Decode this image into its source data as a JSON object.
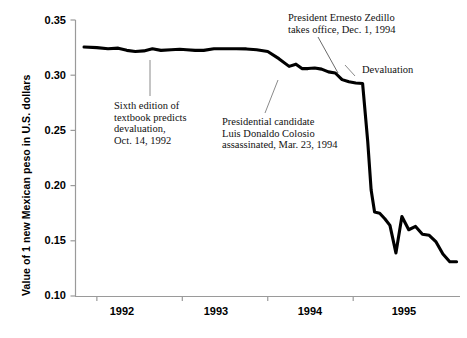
{
  "chart_data": {
    "type": "line",
    "title": "",
    "xlabel": "",
    "ylabel": "Value of 1 new Mexican peso in U.S. dollars",
    "ylim": [
      0.1,
      0.35
    ],
    "xlim": [
      1991.5,
      1996.0
    ],
    "yticks": [
      "0.35",
      "0.30",
      "0.25",
      "0.20",
      "0.15",
      "0.10"
    ],
    "ytick_values": [
      0.35,
      0.3,
      0.25,
      0.2,
      0.15,
      0.1
    ],
    "xticks": [
      "1992",
      "1993",
      "1994",
      "1995"
    ],
    "xtick_values": [
      1992,
      1993,
      1994,
      1995
    ],
    "grid": false,
    "legend": null,
    "series": [
      {
        "name": "Mexican peso value in U.S. dollars",
        "color": "#000000",
        "x": [
          1991.6,
          1991.75,
          1991.88,
          1992.0,
          1992.1,
          1992.2,
          1992.3,
          1992.4,
          1992.5,
          1992.62,
          1992.72,
          1992.8,
          1992.9,
          1993.0,
          1993.12,
          1993.25,
          1993.38,
          1993.5,
          1993.62,
          1993.75,
          1993.88,
          1994.0,
          1994.08,
          1994.15,
          1994.22,
          1994.3,
          1994.38,
          1994.46,
          1994.54,
          1994.62,
          1994.7,
          1994.78,
          1994.86,
          1994.92,
          1994.96,
          1995.0,
          1995.06,
          1995.12,
          1995.18,
          1995.25,
          1995.32,
          1995.4,
          1995.48,
          1995.56,
          1995.64,
          1995.72,
          1995.8,
          1995.88,
          1995.96
        ],
        "y": [
          0.3255,
          0.325,
          0.324,
          0.3245,
          0.3225,
          0.3215,
          0.322,
          0.324,
          0.3225,
          0.323,
          0.3235,
          0.323,
          0.3225,
          0.3225,
          0.324,
          0.324,
          0.324,
          0.3238,
          0.323,
          0.3215,
          0.315,
          0.308,
          0.31,
          0.306,
          0.306,
          0.3065,
          0.3055,
          0.303,
          0.302,
          0.296,
          0.294,
          0.293,
          0.2925,
          0.24,
          0.196,
          0.176,
          0.175,
          0.17,
          0.164,
          0.139,
          0.172,
          0.16,
          0.163,
          0.156,
          0.155,
          0.149,
          0.138,
          0.131,
          0.131
        ]
      }
    ],
    "annotations": [
      {
        "id": "textbook",
        "lines": [
          "Sixth edition of",
          "textbook predicts",
          "devaluation,",
          "Oct. 14, 1992"
        ],
        "text": "Sixth edition of textbook predicts devaluation, Oct. 14, 1992",
        "date": "Oct. 14, 1992"
      },
      {
        "id": "colosio",
        "lines": [
          "Presidential candidate",
          "Luis Donaldo Colosio",
          "assassinated, Mar. 23, 1994"
        ],
        "text": "Presidential candidate Luis Donaldo Colosio assassinated, Mar. 23, 1994",
        "date": "Mar. 23, 1994"
      },
      {
        "id": "zedillo",
        "lines": [
          "President Ernesto Zedillo",
          "takes office, Dec. 1, 1994"
        ],
        "text": "President Ernesto Zedillo takes office, Dec. 1, 1994",
        "date": "Dec. 1, 1994"
      },
      {
        "id": "devaluation",
        "lines": [
          "Devaluation"
        ],
        "text": "Devaluation",
        "date": ""
      }
    ],
    "colors": {
      "line": "#000000",
      "axis": "#9a9a9a",
      "text": "#000000",
      "leader": "#8a8a8a",
      "background": "#ffffff"
    }
  }
}
